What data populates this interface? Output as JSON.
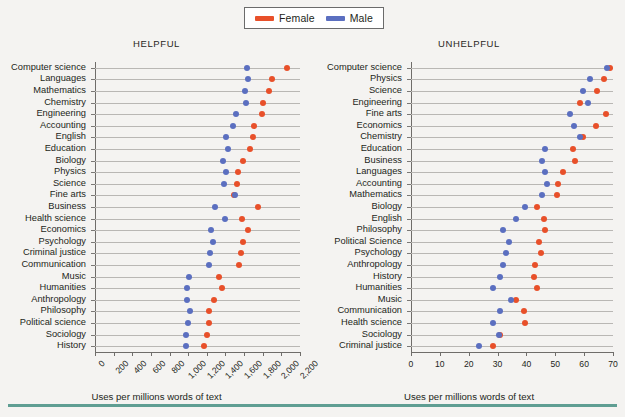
{
  "legend": {
    "items": [
      {
        "label": "Female",
        "color": "#e8502a",
        "key": "female"
      },
      {
        "label": "Male",
        "color": "#5b6fc0",
        "key": "male"
      }
    ]
  },
  "figure": {
    "axis_title": "Uses per millions words of text",
    "accent_rule_color": "#5f9e93",
    "background": "#f4f3f1"
  },
  "chart_data": [
    {
      "type": "scatter",
      "title": "HELPFUL",
      "xlabel": "Uses per millions words of text",
      "ylabel": "",
      "xlim": [
        0,
        2200
      ],
      "xticks": [
        0,
        200,
        400,
        600,
        800,
        1000,
        1200,
        1400,
        1600,
        1800,
        2000,
        2200
      ],
      "xticklabels": [
        "0",
        "200",
        "400",
        "600",
        "800",
        "1,000",
        "1,200",
        "1,400",
        "1,600",
        "1,800",
        "2,000",
        "2,200"
      ],
      "tick_label_rotation": -45,
      "grid": "horizontal",
      "legend_position": "top-center",
      "categories": [
        "Computer science",
        "Languages",
        "Mathematics",
        "Chemistry",
        "Engineering",
        "Accounting",
        "English",
        "Education",
        "Biology",
        "Physics",
        "Science",
        "Fine arts",
        "Business",
        "Health science",
        "Economics",
        "Psychology",
        "Criminal justice",
        "Communication",
        "Music",
        "Humanities",
        "Anthropology",
        "Philosophy",
        "Political science",
        "Sociology",
        "History"
      ],
      "series": [
        {
          "name": "Female",
          "color": "#e8502a",
          "values": [
            2060,
            1900,
            1870,
            1800,
            1790,
            1710,
            1700,
            1660,
            1590,
            1530,
            1520,
            1490,
            1750,
            1580,
            1640,
            1590,
            1570,
            1540,
            1330,
            1360,
            1280,
            1220,
            1220,
            1200,
            1170
          ]
        },
        {
          "name": "Male",
          "color": "#5b6fc0",
          "values": [
            1630,
            1640,
            1610,
            1620,
            1510,
            1480,
            1410,
            1430,
            1370,
            1410,
            1380,
            1500,
            1290,
            1390,
            1250,
            1270,
            1230,
            1220,
            1010,
            990,
            990,
            1020,
            1000,
            980,
            980
          ]
        }
      ]
    },
    {
      "type": "scatter",
      "title": "UNHELPFUL",
      "xlabel": "Uses per millions words of text",
      "ylabel": "",
      "xlim": [
        0,
        70
      ],
      "xticks": [
        0,
        10,
        20,
        30,
        40,
        50,
        60,
        70
      ],
      "xticklabels": [
        "0",
        "10",
        "20",
        "30",
        "40",
        "50",
        "60",
        "70"
      ],
      "tick_label_rotation": 0,
      "grid": "horizontal",
      "legend_position": "top-center",
      "categories": [
        "Computer science",
        "Physics",
        "Science",
        "Engineering",
        "Fine arts",
        "Economics",
        "Chemistry",
        "Education",
        "Business",
        "Languages",
        "Accounting",
        "Mathematics",
        "Biology",
        "English",
        "Philosophy",
        "Political Science",
        "Psychology",
        "Anthropology",
        "History",
        "Humanities",
        "Music",
        "Communication",
        "Health science",
        "Sociology",
        "Criminal justice"
      ],
      "series": [
        {
          "name": "Female",
          "color": "#e8502a",
          "values": [
            69.0,
            67.0,
            64.5,
            58.5,
            67.5,
            64.0,
            59.5,
            56.0,
            57.0,
            52.5,
            51.0,
            50.5,
            43.5,
            46.0,
            46.5,
            44.5,
            45.0,
            43.0,
            42.5,
            43.5,
            36.5,
            39.0,
            39.5,
            31.0,
            28.5
          ]
        },
        {
          "name": "Male",
          "color": "#5b6fc0",
          "values": [
            68.0,
            62.0,
            59.5,
            61.5,
            55.0,
            56.5,
            58.5,
            46.5,
            45.5,
            46.5,
            47.0,
            45.5,
            39.5,
            36.5,
            32.0,
            34.0,
            33.0,
            32.0,
            31.0,
            28.5,
            34.5,
            31.0,
            28.5,
            30.5,
            23.5
          ]
        }
      ]
    }
  ]
}
